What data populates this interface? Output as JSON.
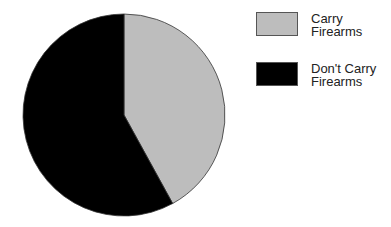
{
  "chart_data": {
    "type": "pie",
    "title": "",
    "categories": [
      "Carry Firearms",
      "Don't Carry Firearms"
    ],
    "values": [
      42,
      58
    ],
    "colors": [
      "#bdbdbd",
      "#000000"
    ],
    "start_angle_deg": 0,
    "direction": "clockwise",
    "legend_position": "right"
  },
  "legend": {
    "items": [
      {
        "label": "Carry\nFirearms",
        "color": "#bdbdbd"
      },
      {
        "label": "Don't Carry\nFirearms",
        "color": "#000000"
      }
    ]
  }
}
